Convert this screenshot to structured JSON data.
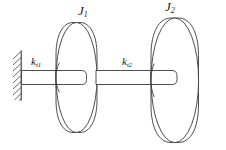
{
  "figure": {
    "background_color": "#ffffff",
    "line_color": "#3a3a3a",
    "width": 226,
    "height": 150
  },
  "labels": {
    "inertia_1": {
      "symbol": "J",
      "subscript": "1",
      "name": "J1"
    },
    "inertia_2": {
      "symbol": "J",
      "subscript": "2",
      "name": "J2"
    },
    "stiffness_1": {
      "symbol": "k",
      "subscript": "t1",
      "name": "kt1"
    },
    "stiffness_2": {
      "symbol": "k",
      "subscript": "t2",
      "name": "kt2"
    }
  },
  "components": {
    "wall": {
      "name": "fixed-support-wall",
      "hatch_count": 9
    },
    "shaft_1": {
      "name": "torsional-shaft-1",
      "label": "kt1"
    },
    "shaft_2": {
      "name": "torsional-shaft-2",
      "label": "kt2"
    },
    "disk_1": {
      "name": "rotor-disk-1",
      "label": "J1"
    },
    "disk_2": {
      "name": "rotor-disk-2",
      "label": "J2"
    }
  }
}
